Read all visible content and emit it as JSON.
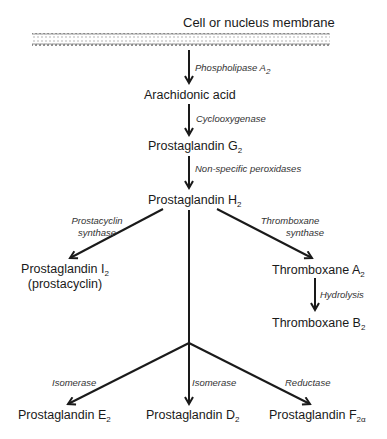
{
  "title": "Cell or nucleus membrane",
  "nodes": {
    "arachidonic": "Arachidonic acid",
    "pgg": {
      "base": "Prostaglandin G",
      "sub": "2"
    },
    "pgh": {
      "base": "Prostaglandin H",
      "sub": "2"
    },
    "pgi": {
      "base": "Prostaglandin I",
      "sub": "2",
      "note": "(prostacyclin)"
    },
    "txa": {
      "base": "Thromboxane A",
      "sub": "2"
    },
    "txb": {
      "base": "Thromboxane B",
      "sub": "2"
    },
    "pge": {
      "base": "Prostaglandin E",
      "sub": "2"
    },
    "pgd": {
      "base": "Prostaglandin D",
      "sub": "2"
    },
    "pgf": {
      "base": "Prostaglandin F",
      "sub": "2α"
    }
  },
  "enzymes": {
    "phospholipase": {
      "base": "Phospholipase A",
      "sub": "2"
    },
    "cyclooxygenase": "Cyclooxygenase",
    "peroxidases": "Non-specific peroxidases",
    "prostacyclin_synthase": [
      "Prostacyclin",
      "synthase"
    ],
    "thromboxane_synthase": [
      "Thromboxane",
      "synthase"
    ],
    "hydrolysis": "Hydrolysis",
    "isomerase_e": "Isomerase",
    "isomerase_d": "Isomerase",
    "reductase": "Reductase"
  },
  "colors": {
    "line": "#1a1a1a",
    "membrane": "#8a8a8a"
  }
}
